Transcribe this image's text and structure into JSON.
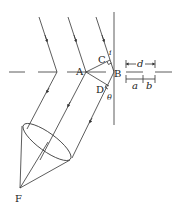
{
  "diagram": {
    "points": {
      "A": "A",
      "B": "B",
      "C": "C",
      "D": "D",
      "F": "F"
    },
    "angles": {
      "incidence": "i",
      "diffraction": "θ"
    },
    "dimensions": {
      "period": "d",
      "slit_width": "a",
      "opaque_width": "b"
    },
    "colors": {
      "line": "#333333",
      "background": "#ffffff"
    }
  }
}
